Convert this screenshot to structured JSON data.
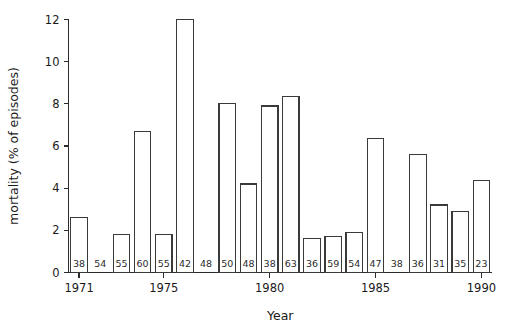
{
  "chart_data": {
    "type": "bar",
    "title": "",
    "xlabel": "Year",
    "ylabel": "mortality (% of episodes)",
    "xlim": [
      1970.5,
      1990.5
    ],
    "ylim": [
      0,
      12
    ],
    "grid": false,
    "legend": null,
    "ytick_labels": [
      "0",
      "2",
      "4",
      "6",
      "8",
      "10",
      "12"
    ],
    "ytick_values": [
      0,
      2,
      4,
      6,
      8,
      10,
      12
    ],
    "xtick_labels": [
      "1971",
      "1975",
      "1980",
      "1985",
      "1990"
    ],
    "xtick_values": [
      1971,
      1975,
      1980,
      1985,
      1990
    ],
    "categories": [
      1971,
      1972,
      1973,
      1974,
      1975,
      1976,
      1977,
      1978,
      1979,
      1980,
      1981,
      1982,
      1983,
      1984,
      1985,
      1986,
      1987,
      1988,
      1989,
      1990
    ],
    "values": [
      2.6,
      0.0,
      1.8,
      6.7,
      1.8,
      12.0,
      0.0,
      8.0,
      4.2,
      7.9,
      8.35,
      1.6,
      1.7,
      1.9,
      6.35,
      0.0,
      5.6,
      3.2,
      2.9,
      4.35
    ],
    "bar_annotations": [
      "38",
      "54",
      "55",
      "60",
      "55",
      "42",
      "48",
      "50",
      "48",
      "38",
      "63",
      "36",
      "59",
      "54",
      "47",
      "38",
      "36",
      "31",
      "35",
      "23"
    ],
    "annotation_meaning": "number of episodes (n) printed inside the base of each bar",
    "series": [
      {
        "name": "mortality (% of episodes)",
        "values": [
          2.6,
          0.0,
          1.8,
          6.7,
          1.8,
          12.0,
          0.0,
          8.0,
          4.2,
          7.9,
          8.35,
          1.6,
          1.7,
          1.9,
          6.35,
          0.0,
          5.6,
          3.2,
          2.9,
          4.35
        ]
      }
    ]
  }
}
